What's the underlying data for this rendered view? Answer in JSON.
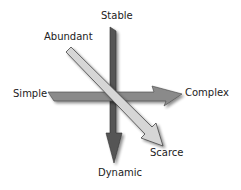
{
  "diagram": {
    "axes": [
      {
        "id": "horizontal",
        "from_label": "Simple",
        "to_label": "Complex",
        "color": "#8a8a8a"
      },
      {
        "id": "vertical",
        "from_label": "Stable",
        "to_label": "Dynamic",
        "color": "#555555"
      },
      {
        "id": "diagonal",
        "from_label": "Abundant",
        "to_label": "Scarce",
        "color": "#d6d6d6"
      }
    ]
  }
}
